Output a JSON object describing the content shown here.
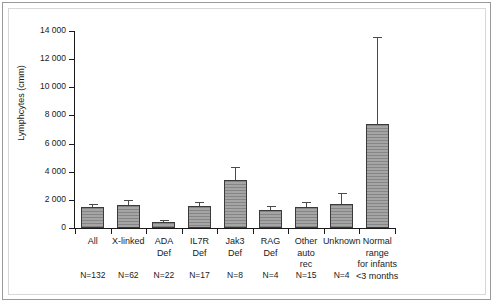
{
  "figure": {
    "background_color": "#ffffff",
    "frame_color": "#9a9a9a",
    "bar_fill_color": "#9b9b9b",
    "bar_edge_color": "#3a3a3a",
    "axis_color": "#1a1a1a"
  },
  "chart_data": {
    "type": "bar",
    "title": "",
    "xlabel": "",
    "ylabel": "Lymphcytes (cmm)",
    "ylim": [
      0,
      14000
    ],
    "ytick_labels": [
      "14 000",
      "12 000",
      "10 000",
      "8 000",
      "6 000",
      "4 000",
      "2 000",
      "0"
    ],
    "ytick_values": [
      14000,
      12000,
      10000,
      8000,
      6000,
      4000,
      2000,
      0
    ],
    "grid": false,
    "legend": null,
    "categories": [
      "All",
      "X-linked",
      "ADA Def",
      "IL7R Def",
      "Jak3 Def",
      "RAG Def",
      "Other auto rec",
      "Unknown",
      "Normal range for infants <3 months"
    ],
    "category_label_lines": [
      [
        "All"
      ],
      [
        "X-linked"
      ],
      [
        "ADA",
        "Def"
      ],
      [
        "IL7R",
        "Def"
      ],
      [
        "Jak3",
        "Def"
      ],
      [
        "RAG",
        "Def"
      ],
      [
        "Other",
        "auto",
        "rec"
      ],
      [
        "Unknown"
      ],
      [
        "Normal",
        "range",
        "for infants",
        "<3 months"
      ]
    ],
    "values": [
      1500,
      1630,
      430,
      1530,
      3420,
      1290,
      1500,
      1700,
      7400
    ],
    "errors_upper": [
      1650,
      1900,
      500,
      1750,
      4250,
      1480,
      1810,
      2400,
      13500
    ],
    "sample_sizes": [
      "N=132",
      "N=62",
      "N=22",
      "N=17",
      "N=8",
      "N=4",
      "N=15",
      "N=4",
      ""
    ],
    "bars": [
      {
        "label": "All",
        "value": 1500,
        "error_top": 1650,
        "n": "N=132"
      },
      {
        "label": "X-linked",
        "value": 1630,
        "error_top": 1900,
        "n": "N=62"
      },
      {
        "label": "ADA Def",
        "value": 430,
        "error_top": 500,
        "n": "N=22"
      },
      {
        "label": "IL7R Def",
        "value": 1530,
        "error_top": 1750,
        "n": "N=17"
      },
      {
        "label": "Jak3 Def",
        "value": 3420,
        "error_top": 4250,
        "n": "N=8"
      },
      {
        "label": "RAG Def",
        "value": 1290,
        "error_top": 1480,
        "n": "N=4"
      },
      {
        "label": "Other auto rec",
        "value": 1500,
        "error_top": 1810,
        "n": "N=15"
      },
      {
        "label": "Unknown",
        "value": 1700,
        "error_top": 2400,
        "n": "N=4"
      },
      {
        "label": "Normal range for infants <3 months",
        "value": 7400,
        "error_top": 13500,
        "n": ""
      }
    ]
  }
}
